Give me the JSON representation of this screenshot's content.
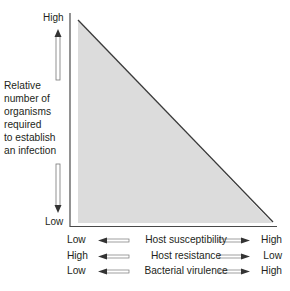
{
  "y_axis": {
    "high_label": "High",
    "low_label": "Low",
    "title_lines": [
      "Relative",
      "number of",
      "organisms",
      "required",
      "to establish",
      "an infection"
    ]
  },
  "x_axis_rows": [
    {
      "left": "Low",
      "label": "Host susceptibility",
      "right": "High"
    },
    {
      "left": "High",
      "label": "Host resistance",
      "right": "Low"
    },
    {
      "left": "Low",
      "label": "Bacterial virulence",
      "right": "High"
    }
  ],
  "colors": {
    "fill": "#dcdcdc",
    "line": "#3a3a3a",
    "axis": "#4a4a4a",
    "text": "#231f20"
  }
}
